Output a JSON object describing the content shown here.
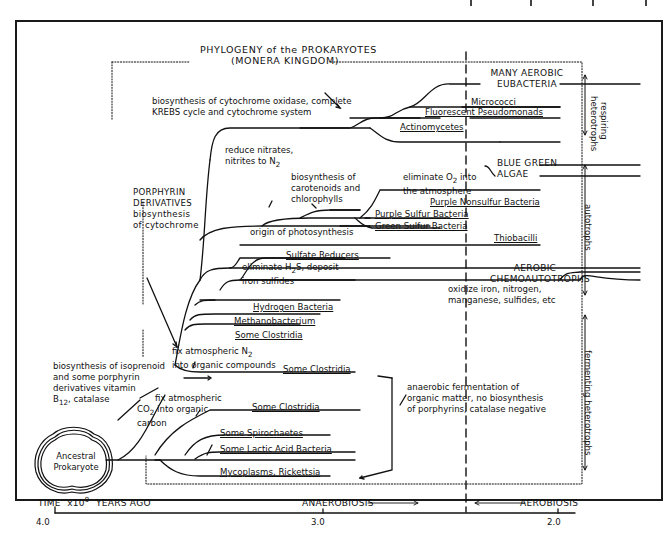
{
  "title": {
    "line1": "PHYLOGENY of the PROKARYOTES",
    "line2": "(MONERA KINGDOM)"
  },
  "root": {
    "label_line1": "Ancestral",
    "label_line2": "Prokaryote"
  },
  "lineages": [
    {
      "id": "many-aerobic-eubacteria",
      "line1": "MANY AEROBIC",
      "line2": "EUBACTERIA"
    },
    {
      "id": "micrococci",
      "label": "Micrococci"
    },
    {
      "id": "fluorescent-pseudomonads",
      "label": "Fluorescent Pseudomonads"
    },
    {
      "id": "actinomycetes",
      "label": "Actinomycetes"
    },
    {
      "id": "blue-green-algae",
      "line1": "BLUE GREEN",
      "line2": "ALGAE"
    },
    {
      "id": "purple-nonsulfur-bacteria",
      "label": "Purple Nonsulfur Bacteria"
    },
    {
      "id": "purple-sulfur-bacteria",
      "label": "Purple Sulfur Bacteria"
    },
    {
      "id": "green-sulfur-bacteria",
      "label": "Green Sulfur Bacteria"
    },
    {
      "id": "thiobacilli",
      "label": "Thiobacilli"
    },
    {
      "id": "sulfate-reducers",
      "label": "Sulfate Reducers"
    },
    {
      "id": "aerobic-chemoautotrophs",
      "line1": "AEROBIC",
      "line2": "CHEMOAUTOTROPHS"
    },
    {
      "id": "hydrogen-bacteria",
      "label": "Hydrogen Bacteria"
    },
    {
      "id": "methanobacterium",
      "label": "Methanobacterium"
    },
    {
      "id": "some-clostridia-1",
      "label": "Some Clostridia"
    },
    {
      "id": "some-clostridia-2",
      "label": "Some Clostridia"
    },
    {
      "id": "some-clostridia-3",
      "label": "Some Clostridia"
    },
    {
      "id": "some-spirochaetes",
      "label": "Some Spirochaetes"
    },
    {
      "id": "some-lactic-acid-bacteria",
      "label": "Some Lactic Acid Bacteria"
    },
    {
      "id": "mycoplasms-rickettsia",
      "label": "Mycoplasms, Rickettsia"
    }
  ],
  "annotations": {
    "cytochrome_oxidase": {
      "line1": "biosynthesis of cytochrome oxidase, complete",
      "line2": "KREBS cycle and cytochrome system"
    },
    "reduce_nitrates": {
      "line1": "reduce nitrates,",
      "line2": "nitrites to N",
      "sub": "2"
    },
    "carotenoids": {
      "line1": "biosynthesis of",
      "line2": "carotenoids and",
      "line3": "chlorophylls"
    },
    "eliminate_o2": {
      "line1": "eliminate O",
      "sub": "2",
      "line1b": " into",
      "line2": "the atmosphere"
    },
    "origin_photosynthesis": "origin of photosynthesis",
    "porphyrin": {
      "line1": "PORPHYRIN",
      "line2": "DERIVATIVES",
      "line3": "biosynthesis",
      "line4": "of cytochrome"
    },
    "eliminate_h2s": {
      "line1a": "eliminate H",
      "sub": "2",
      "line1b": "S, deposit",
      "line2": "iron sulfides"
    },
    "oxidize_iron": {
      "line1": "oxidize iron, nitrogen,",
      "line2": "manganese, sulfides, etc"
    },
    "fix_n2": {
      "line1": "fix atmospheric N",
      "sub": "2",
      "line2": "into organic compounds"
    },
    "isoprenoid": {
      "line1": "biosynthesis of isoprenoid",
      "line2": "and some porphyrin",
      "line3": "derivatives vitamin",
      "line4a": "B",
      "sub": "12",
      "line4b": ", catalase"
    },
    "fix_co2": {
      "line1": "fix atmospheric",
      "line2a": "CO",
      "sub": "2",
      "line2b": " into organic",
      "line3": "carbon"
    },
    "anaerobic_fermentation": {
      "line1": "anaerobic fermentation of",
      "line2": "organic matter, no biosynthesis",
      "line3": "of porphyrins, catalase negative"
    }
  },
  "side_groups": {
    "respiring": {
      "line1": "respiring",
      "line2": "heterotrophs"
    },
    "autotrophs": "autotrophs",
    "fermenting": "fermenting heterotrophs"
  },
  "time_axis": {
    "label": "TIME  x10",
    "exp": "9",
    "label_tail": "  YEARS AGO",
    "ticks": [
      "4.0",
      "3.0",
      "2.0"
    ],
    "anaerobiosis": "ANAEROBIOSIS",
    "aerobiosis": "AEROBIOSIS"
  }
}
